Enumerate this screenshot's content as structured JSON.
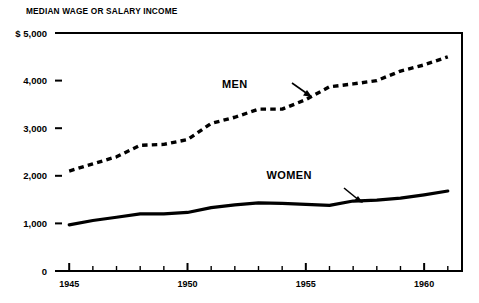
{
  "chart_data": {
    "type": "line",
    "title": "MEDIAN WAGE OR SALARY INCOME",
    "xlabel": "",
    "ylabel": "",
    "xlim": [
      1944.4,
      1961.6
    ],
    "ylim": [
      0,
      5000
    ],
    "grid": false,
    "legend_position": "inline-annotations",
    "y_ticks": [
      0,
      1000,
      2000,
      3000,
      4000,
      5000
    ],
    "y_tick_labels": [
      "0",
      "1,000",
      "2,000",
      "3,000",
      "4,000",
      "$ 5,000"
    ],
    "x_ticks": [
      1945,
      1946,
      1947,
      1948,
      1949,
      1950,
      1951,
      1952,
      1953,
      1954,
      1955,
      1956,
      1957,
      1958,
      1959,
      1960,
      1961
    ],
    "x_tick_labels_major": [
      "1945",
      "1950",
      "1955",
      "1960"
    ],
    "x_major_ticks": [
      1945,
      1950,
      1955,
      1960
    ],
    "x": [
      1945,
      1946,
      1947,
      1948,
      1949,
      1950,
      1951,
      1952,
      1953,
      1954,
      1955,
      1956,
      1957,
      1958,
      1959,
      1960,
      1961
    ],
    "series": [
      {
        "name": "MEN",
        "style": "dashed",
        "values": [
          2100,
          2250,
          2400,
          2640,
          2660,
          2760,
          3100,
          3230,
          3400,
          3400,
          3600,
          3870,
          3930,
          4000,
          4200,
          4330,
          4500
        ]
      },
      {
        "name": "WOMEN",
        "style": "solid",
        "values": [
          970,
          1060,
          1130,
          1200,
          1200,
          1230,
          1330,
          1390,
          1430,
          1420,
          1400,
          1380,
          1470,
          1490,
          1530,
          1600,
          1680
        ]
      }
    ],
    "annotations": [
      {
        "text": "MEN",
        "x": 1952.0,
        "y": 3850
      },
      {
        "text": "WOMEN",
        "x": 1954.3,
        "y": 1930
      }
    ]
  },
  "accent_color": "#000000",
  "background_color": "#ffffff"
}
